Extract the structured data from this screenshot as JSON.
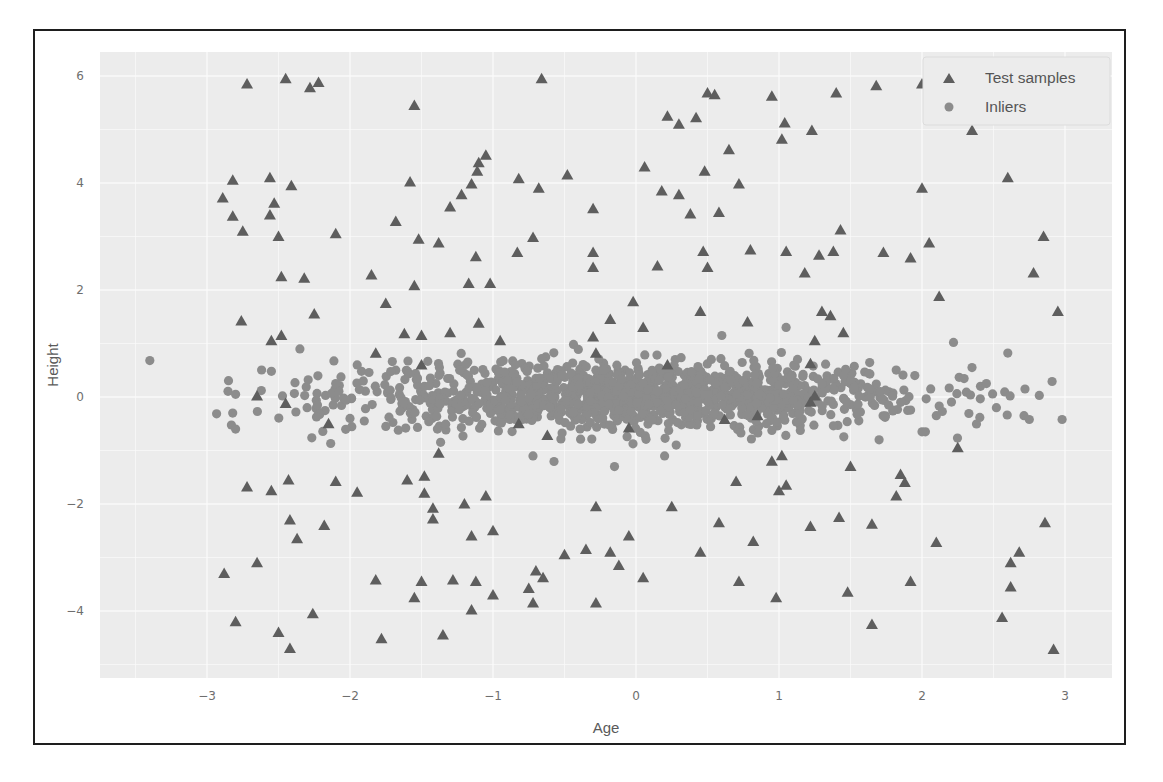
{
  "chart_data": {
    "type": "scatter",
    "title": "",
    "xlabel": "Age",
    "ylabel": "Height",
    "xlim": [
      -3.75,
      3.33
    ],
    "ylim": [
      -5.1,
      6.6
    ],
    "xticks": [
      -3,
      -2,
      -1,
      0,
      1,
      2,
      3
    ],
    "yticks": [
      -4,
      -2,
      0,
      2,
      4,
      6
    ],
    "xtick_labels": [
      "−3",
      "−2",
      "−1",
      "0",
      "1",
      "2",
      "3"
    ],
    "ytick_labels": [
      "−4",
      "−2",
      "0",
      "2",
      "4",
      "6"
    ],
    "grid": true,
    "legend_position": "upper right",
    "legend": [
      {
        "label": "Test samples",
        "marker": "triangle"
      },
      {
        "label": "Inliers",
        "marker": "circle"
      }
    ],
    "colors": {
      "test_samples": "#5e5e5e",
      "inliers": "#8c8c8c",
      "plot_background": "#ececec",
      "grid": "#fafafa"
    },
    "series": [
      {
        "name": "Test samples",
        "marker": "triangle",
        "points": [
          [
            -2.72,
            5.85
          ],
          [
            -2.45,
            5.95
          ],
          [
            -2.28,
            5.78
          ],
          [
            -2.22,
            5.88
          ],
          [
            -1.55,
            5.45
          ],
          [
            -0.66,
            5.95
          ],
          [
            -2.89,
            3.72
          ],
          [
            -2.82,
            4.05
          ],
          [
            -2.82,
            3.38
          ],
          [
            -2.75,
            3.1
          ],
          [
            -2.56,
            4.1
          ],
          [
            -2.53,
            3.62
          ],
          [
            -2.56,
            3.4
          ],
          [
            -2.5,
            3.0
          ],
          [
            -2.41,
            3.95
          ],
          [
            -2.48,
            2.25
          ],
          [
            -2.32,
            2.22
          ],
          [
            -2.1,
            3.05
          ],
          [
            -2.25,
            1.55
          ],
          [
            -2.76,
            1.42
          ],
          [
            -2.55,
            1.05
          ],
          [
            -2.48,
            1.15
          ],
          [
            -2.65,
            0.02
          ],
          [
            -2.15,
            -0.5
          ],
          [
            -1.58,
            4.02
          ],
          [
            -1.52,
            2.95
          ],
          [
            -1.55,
            2.08
          ],
          [
            -1.38,
            2.88
          ],
          [
            -1.3,
            3.55
          ],
          [
            -1.22,
            3.78
          ],
          [
            -1.15,
            3.98
          ],
          [
            -1.11,
            4.22
          ],
          [
            -1.1,
            4.38
          ],
          [
            -1.05,
            4.52
          ],
          [
            -0.82,
            4.08
          ],
          [
            -0.68,
            3.9
          ],
          [
            -0.48,
            4.15
          ],
          [
            -0.3,
            3.52
          ],
          [
            -1.68,
            3.28
          ],
          [
            -1.85,
            2.28
          ],
          [
            -1.12,
            2.62
          ],
          [
            -1.17,
            2.12
          ],
          [
            -1.02,
            2.12
          ],
          [
            -0.83,
            2.7
          ],
          [
            -0.72,
            2.98
          ],
          [
            -0.3,
            2.7
          ],
          [
            -0.3,
            2.42
          ],
          [
            -1.75,
            1.75
          ],
          [
            -1.62,
            1.18
          ],
          [
            -1.5,
            1.15
          ],
          [
            -1.3,
            1.2
          ],
          [
            -1.1,
            1.38
          ],
          [
            -0.95,
            1.05
          ],
          [
            -1.82,
            0.82
          ],
          [
            -1.5,
            0.6
          ],
          [
            0.22,
            5.25
          ],
          [
            0.18,
            3.85
          ],
          [
            0.06,
            4.3
          ],
          [
            0.3,
            5.1
          ],
          [
            0.42,
            5.22
          ],
          [
            0.5,
            5.68
          ],
          [
            0.55,
            5.65
          ],
          [
            0.48,
            4.22
          ],
          [
            0.3,
            3.78
          ],
          [
            0.58,
            3.45
          ],
          [
            0.5,
            2.42
          ],
          [
            0.38,
            3.42
          ],
          [
            0.47,
            2.72
          ],
          [
            0.65,
            4.62
          ],
          [
            0.72,
            3.98
          ],
          [
            0.8,
            2.75
          ],
          [
            0.95,
            5.62
          ],
          [
            1.02,
            4.82
          ],
          [
            1.04,
            5.12
          ],
          [
            1.05,
            2.72
          ],
          [
            1.18,
            2.32
          ],
          [
            1.23,
            4.98
          ],
          [
            1.28,
            2.65
          ],
          [
            1.38,
            2.72
          ],
          [
            1.4,
            5.68
          ],
          [
            1.43,
            3.12
          ],
          [
            1.68,
            5.82
          ],
          [
            1.73,
            2.7
          ],
          [
            1.92,
            2.6
          ],
          [
            2.0,
            5.85
          ],
          [
            2.0,
            3.9
          ],
          [
            2.05,
            2.88
          ],
          [
            2.12,
            1.88
          ],
          [
            2.35,
            4.98
          ],
          [
            2.6,
            4.1
          ],
          [
            2.78,
            2.32
          ],
          [
            2.85,
            3.0
          ],
          [
            2.95,
            1.6
          ],
          [
            0.05,
            1.3
          ],
          [
            -0.02,
            1.78
          ],
          [
            -0.18,
            1.45
          ],
          [
            -0.3,
            1.12
          ],
          [
            0.15,
            2.45
          ],
          [
            0.45,
            1.6
          ],
          [
            0.78,
            1.4
          ],
          [
            1.3,
            1.6
          ],
          [
            1.36,
            1.52
          ],
          [
            1.25,
            1.05
          ],
          [
            1.45,
            1.2
          ],
          [
            1.22,
            0.62
          ],
          [
            -0.28,
            0.82
          ],
          [
            0.22,
            0.6
          ],
          [
            -2.8,
            -4.2
          ],
          [
            -2.88,
            -3.3
          ],
          [
            -2.65,
            -3.1
          ],
          [
            -2.72,
            -1.68
          ],
          [
            -2.55,
            -1.75
          ],
          [
            -2.43,
            -1.55
          ],
          [
            -2.42,
            -2.3
          ],
          [
            -2.37,
            -2.65
          ],
          [
            -2.5,
            -4.4
          ],
          [
            -2.42,
            -4.7
          ],
          [
            -2.26,
            -4.05
          ],
          [
            -2.18,
            -2.4
          ],
          [
            -2.1,
            -1.58
          ],
          [
            -1.95,
            -1.78
          ],
          [
            -1.82,
            -3.42
          ],
          [
            -1.78,
            -4.52
          ],
          [
            -1.6,
            -1.55
          ],
          [
            -1.55,
            -3.75
          ],
          [
            -1.5,
            -3.45
          ],
          [
            -1.48,
            -1.8
          ],
          [
            -1.42,
            -2.08
          ],
          [
            -1.42,
            -2.28
          ],
          [
            -1.28,
            -3.42
          ],
          [
            -1.35,
            -4.45
          ],
          [
            -1.2,
            -2.0
          ],
          [
            -1.15,
            -2.6
          ],
          [
            -1.12,
            -3.45
          ],
          [
            -1.15,
            -3.98
          ],
          [
            -1.05,
            -1.85
          ],
          [
            -1.0,
            -2.5
          ],
          [
            -1.0,
            -3.7
          ],
          [
            -0.75,
            -3.58
          ],
          [
            -0.7,
            -3.25
          ],
          [
            -0.65,
            -3.38
          ],
          [
            -0.72,
            -3.85
          ],
          [
            -0.5,
            -2.95
          ],
          [
            -0.35,
            -2.85
          ],
          [
            -0.28,
            -3.85
          ],
          [
            -0.28,
            -2.05
          ],
          [
            -0.18,
            -2.9
          ],
          [
            -0.12,
            -3.15
          ],
          [
            -0.05,
            -2.6
          ],
          [
            0.05,
            -3.38
          ],
          [
            0.25,
            -2.05
          ],
          [
            0.45,
            -2.9
          ],
          [
            0.58,
            -2.35
          ],
          [
            0.72,
            -3.45
          ],
          [
            0.82,
            -2.7
          ],
          [
            0.98,
            -3.75
          ],
          [
            1.0,
            -1.75
          ],
          [
            1.05,
            -1.65
          ],
          [
            1.22,
            -2.42
          ],
          [
            1.42,
            -2.25
          ],
          [
            1.48,
            -3.65
          ],
          [
            1.65,
            -2.38
          ],
          [
            1.65,
            -4.25
          ],
          [
            1.82,
            -1.85
          ],
          [
            1.85,
            -1.45
          ],
          [
            1.88,
            -1.6
          ],
          [
            1.92,
            -3.45
          ],
          [
            2.1,
            -2.72
          ],
          [
            2.25,
            -0.95
          ],
          [
            2.56,
            -4.12
          ],
          [
            2.62,
            -3.55
          ],
          [
            2.62,
            -3.1
          ],
          [
            2.68,
            -2.9
          ],
          [
            2.86,
            -2.35
          ],
          [
            2.92,
            -4.72
          ],
          [
            0.7,
            -1.58
          ],
          [
            0.95,
            -1.2
          ],
          [
            1.02,
            -1.1
          ],
          [
            1.5,
            -1.3
          ],
          [
            -1.38,
            -1.05
          ],
          [
            -1.48,
            -1.48
          ],
          [
            -0.82,
            -0.5
          ],
          [
            -0.62,
            -0.72
          ],
          [
            -0.05,
            -0.58
          ],
          [
            0.62,
            -0.42
          ],
          [
            0.85,
            -0.35
          ],
          [
            1.22,
            -0.1
          ],
          [
            1.25,
            0.02
          ],
          [
            -2.45,
            -0.12
          ]
        ]
      },
      {
        "name": "Inliers",
        "marker": "circle",
        "distribution": {
          "kind": "gaussian",
          "count": 1400,
          "x_mean": 0.0,
          "x_std": 1.0,
          "y_mean": 0.0,
          "y_std": 0.3,
          "x_clip": [
            -3.1,
            3.05
          ]
        },
        "sample_points": [
          [
            -3.4,
            0.68
          ],
          [
            -2.8,
            0.05
          ],
          [
            -2.82,
            -0.3
          ],
          [
            -2.8,
            -0.6
          ],
          [
            -2.55,
            0.48
          ],
          [
            -2.62,
            0.12
          ],
          [
            -2.35,
            0.9
          ],
          [
            -2.3,
            -0.2
          ],
          [
            -2.1,
            0.25
          ],
          [
            -2.0,
            -0.4
          ],
          [
            -1.95,
            0.6
          ],
          [
            -1.75,
            -0.55
          ],
          [
            2.35,
            0.55
          ],
          [
            2.45,
            0.25
          ],
          [
            2.52,
            -0.2
          ],
          [
            2.72,
            0.15
          ],
          [
            2.75,
            -0.42
          ],
          [
            2.82,
            0.03
          ],
          [
            2.98,
            -0.42
          ],
          [
            2.22,
            1.02
          ],
          [
            2.6,
            0.82
          ],
          [
            2.1,
            -0.35
          ],
          [
            1.95,
            0.4
          ],
          [
            1.05,
            1.3
          ],
          [
            0.6,
            1.15
          ],
          [
            -0.15,
            -1.3
          ],
          [
            -0.72,
            -1.1
          ],
          [
            0.2,
            -1.1
          ],
          [
            1.7,
            -0.8
          ],
          [
            2.0,
            -0.65
          ]
        ]
      }
    ]
  },
  "legend": {
    "test_label": "Test samples",
    "inlier_label": "Inliers"
  },
  "axes": {
    "xlabel": "Age",
    "ylabel": "Height"
  }
}
